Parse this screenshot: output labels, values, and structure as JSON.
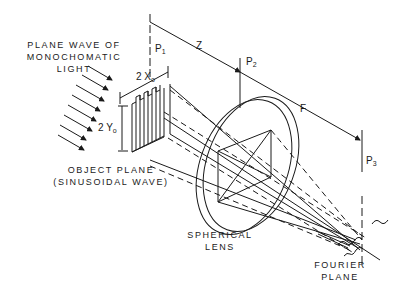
{
  "figure": {
    "labels": {
      "light_source_line1": "PLANE WAVE OF",
      "light_source_line2": "MONOCHOMATIC",
      "light_source_line3": "LIGHT",
      "object_plane_line1": "OBJECT PLANE",
      "object_plane_line2": "(SINUSOIDAL WAVE)",
      "lens_line1": "SPHERICAL",
      "lens_line2": "LENS",
      "fourier_line1": "FOURIER",
      "fourier_line2": "PLANE"
    },
    "symbols": {
      "width": {
        "base": "2 X",
        "sub": "o"
      },
      "height": {
        "base": "2 Y",
        "sub": "o"
      },
      "p1": {
        "base": "P",
        "sub": "1"
      },
      "p2": {
        "base": "P",
        "sub": "2"
      },
      "p3": {
        "base": "P",
        "sub": "3"
      },
      "z": "Z",
      "f": "F"
    },
    "colors": {
      "ink": "#1a1a1a",
      "background": "#ffffff"
    }
  }
}
